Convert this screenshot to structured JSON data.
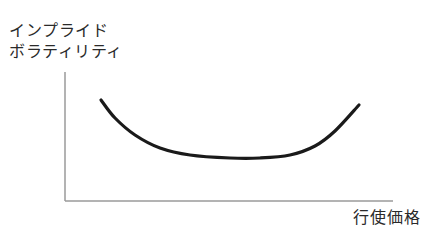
{
  "chart_data": {
    "type": "line",
    "title": "",
    "xlabel": "行使価格",
    "ylabel": "インプライド ボラティリティ",
    "ylabel_lines": [
      "インプライド",
      "ボラティリティ"
    ],
    "grid": false,
    "legend": null,
    "ticks": {
      "x": [],
      "y": []
    },
    "series": [
      {
        "name": "implied volatility",
        "shape": "U-shaped smile",
        "points_px": [
          [
            101,
            100
          ],
          [
            115,
            118
          ],
          [
            135,
            135
          ],
          [
            160,
            148
          ],
          [
            190,
            155
          ],
          [
            230,
            158
          ],
          [
            260,
            158
          ],
          [
            290,
            155
          ],
          [
            315,
            146
          ],
          [
            335,
            131
          ],
          [
            359,
            105
          ]
        ]
      }
    ],
    "colors": {
      "curve": "#1a1a1a",
      "axis": "#9a9a9a",
      "text": "#2a2a2a"
    }
  },
  "labels": {
    "y_line1": "インプライド",
    "y_line2": "ボラティリティ",
    "x": "行使価格"
  }
}
